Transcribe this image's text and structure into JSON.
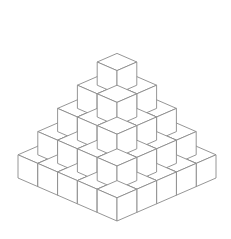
{
  "diagram": {
    "type": "isometric-cube-pyramid",
    "layers": [
      5,
      4,
      3,
      2,
      1
    ],
    "total_cubes": 55,
    "stroke_color": "#8a8a8a",
    "fill_top": "#ffffff",
    "fill_left": "#ffffff",
    "fill_right": "#ffffff",
    "background": "#ffffff",
    "geometry": {
      "origin_front_bottom": [
        117,
        221
      ],
      "dx": 19.8,
      "dy": 8.6,
      "h": 23.2
    }
  }
}
